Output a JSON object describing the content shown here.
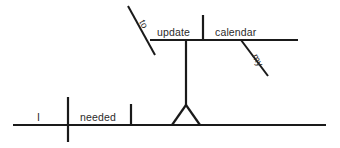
{
  "diagram": {
    "type": "reed-kellogg-sentence-diagram",
    "sentence": "I needed to update my calendar.",
    "ink_color": "#1a1a1a",
    "text_color": "#2b2b2b",
    "background_color": "#ffffff",
    "words": {
      "subject": "I",
      "verb": "needed",
      "infinitive_marker": "to",
      "infinitive_verb": "update",
      "direct_object": "calendar",
      "possessive_modifier": "my"
    },
    "labels": [
      {
        "id": "subject",
        "text": "I",
        "x": 37,
        "y": 121,
        "rotation": 0,
        "role": "subject"
      },
      {
        "id": "verb",
        "text": "needed",
        "x": 80,
        "y": 121,
        "rotation": 0,
        "role": "main-verb"
      },
      {
        "id": "to",
        "text": "to",
        "x": 139,
        "y": 22,
        "rotation": 62,
        "role": "infinitive-marker"
      },
      {
        "id": "update",
        "text": "update",
        "x": 157,
        "y": 36,
        "rotation": 0,
        "role": "infinitive-verb"
      },
      {
        "id": "calendar",
        "text": "calendar",
        "x": 215,
        "y": 36,
        "rotation": 0,
        "role": "direct-object-of-infinitive"
      },
      {
        "id": "my",
        "text": "my",
        "x": 252,
        "y": 56,
        "rotation": 62,
        "role": "possessive-adjective"
      }
    ],
    "strokes": [
      {
        "id": "main-baseline",
        "type": "line",
        "x1": 13,
        "y1": 125,
        "x2": 326,
        "y2": 125,
        "role": "main-clause-baseline"
      },
      {
        "id": "subject-verb-divider",
        "type": "line",
        "x1": 68,
        "y1": 97,
        "x2": 68,
        "y2": 142,
        "role": "subject-verb-separator"
      },
      {
        "id": "verb-object-divider",
        "type": "line",
        "x1": 131,
        "y1": 104,
        "x2": 131,
        "y2": 125,
        "role": "verb-complement-separator"
      },
      {
        "id": "tripod-left-leg",
        "type": "line",
        "x1": 172,
        "y1": 125,
        "x2": 186,
        "y2": 105,
        "role": "infinitive-phrase-stand-left"
      },
      {
        "id": "tripod-right-leg",
        "type": "line",
        "x1": 200,
        "y1": 125,
        "x2": 186,
        "y2": 105,
        "role": "infinitive-phrase-stand-right"
      },
      {
        "id": "tripod-stem",
        "type": "line",
        "x1": 186,
        "y1": 105,
        "x2": 186,
        "y2": 40,
        "role": "infinitive-phrase-stem"
      },
      {
        "id": "infinitive-baseline",
        "type": "line",
        "x1": 150,
        "y1": 40,
        "x2": 298,
        "y2": 40,
        "role": "infinitive-phrase-baseline"
      },
      {
        "id": "infinitive-object-divider",
        "type": "line",
        "x1": 203,
        "y1": 15,
        "x2": 203,
        "y2": 40,
        "role": "infinitive-object-separator"
      },
      {
        "id": "to-slant",
        "type": "line",
        "x1": 128,
        "y1": 6,
        "x2": 155,
        "y2": 55,
        "role": "infinitive-marker-slant"
      },
      {
        "id": "my-slant",
        "type": "line",
        "x1": 241,
        "y1": 40,
        "x2": 268,
        "y2": 76,
        "role": "modifier-slant"
      }
    ]
  }
}
